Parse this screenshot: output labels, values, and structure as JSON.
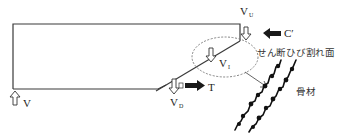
{
  "diagram": {
    "type": "shear crack force diagram (RC beam)",
    "colors": {
      "line": "#3a3a3a",
      "arrow_fill": "#1a1a1a",
      "ellipse": "#777777",
      "background": "#ffffff"
    },
    "forces": {
      "support_reaction": {
        "label": "V",
        "sub": "",
        "direction": "up",
        "icon": "hollow-arrow-up-icon"
      },
      "upper_shear": {
        "label": "V",
        "sub": "U",
        "direction": "down",
        "icon": "hollow-arrow-down-icon"
      },
      "compression": {
        "label": "C′",
        "sub": "",
        "direction": "left",
        "icon": "solid-arrow-left-icon"
      },
      "interlock_shear": {
        "label": "V",
        "sub": "I",
        "direction": "down",
        "icon": "hollow-arrow-down-icon"
      },
      "dowel_shear": {
        "label": "V",
        "sub": "D",
        "direction": "down",
        "icon": "hollow-arrow-down-icon"
      },
      "tension": {
        "label": "T",
        "sub": "",
        "direction": "right",
        "icon": "solid-arrow-right-icon"
      }
    },
    "annotations": {
      "crack_surface": "せん断ひび割れ面",
      "aggregate": "骨材"
    }
  }
}
